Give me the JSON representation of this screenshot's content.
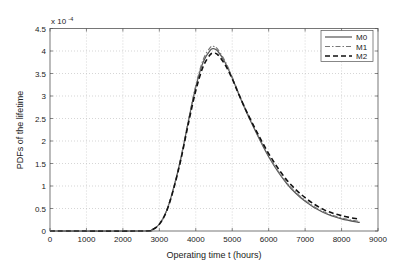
{
  "chart_data": {
    "type": "line",
    "title": "",
    "xlabel": "Operating time t (hours)",
    "ylabel": "PDFs of the lifetime",
    "y_multiplier_label": "x 10",
    "y_multiplier_exponent": "-4",
    "xlim": [
      0,
      9000
    ],
    "ylim": [
      0,
      4.5
    ],
    "xticks": [
      0,
      1000,
      2000,
      3000,
      4000,
      5000,
      6000,
      7000,
      8000,
      9000
    ],
    "yticks": [
      0,
      0.5,
      1,
      1.5,
      2,
      2.5,
      3,
      3.5,
      4,
      4.5
    ],
    "xtick_labels": [
      "0",
      "1000",
      "2000",
      "3000",
      "4000",
      "5000",
      "6000",
      "7000",
      "8000",
      "9000"
    ],
    "ytick_labels": [
      "0",
      "0.5",
      "1",
      "1.5",
      "2",
      "2.5",
      "3",
      "3.5",
      "4",
      "4.5"
    ],
    "grid": true,
    "legend_position": "top-right",
    "x": [
      0,
      2500,
      2800,
      3000,
      3200,
      3400,
      3600,
      3800,
      4000,
      4200,
      4400,
      4500,
      4600,
      4800,
      5000,
      5200,
      5500,
      6000,
      6500,
      7000,
      7500,
      8000,
      8500
    ],
    "series": [
      {
        "name": "M0",
        "style": "solid",
        "color": "#555555",
        "values": [
          0,
          0,
          0.03,
          0.15,
          0.45,
          0.98,
          1.65,
          2.45,
          3.2,
          3.75,
          4.02,
          4.05,
          4.0,
          3.75,
          3.4,
          3.0,
          2.45,
          1.65,
          1.05,
          0.66,
          0.41,
          0.27,
          0.19
        ]
      },
      {
        "name": "M1",
        "style": "dashdot",
        "color": "#777777",
        "values": [
          0,
          0,
          0.03,
          0.15,
          0.45,
          0.98,
          1.66,
          2.47,
          3.23,
          3.8,
          4.08,
          4.1,
          4.04,
          3.78,
          3.42,
          3.02,
          2.47,
          1.67,
          1.07,
          0.68,
          0.43,
          0.29,
          0.21
        ]
      },
      {
        "name": "M2",
        "style": "dashed",
        "color": "#111111",
        "values": [
          0,
          0,
          0.03,
          0.15,
          0.44,
          0.96,
          1.62,
          2.4,
          3.12,
          3.65,
          3.92,
          3.95,
          3.92,
          3.7,
          3.38,
          3.0,
          2.48,
          1.72,
          1.13,
          0.74,
          0.48,
          0.34,
          0.26
        ]
      }
    ]
  }
}
